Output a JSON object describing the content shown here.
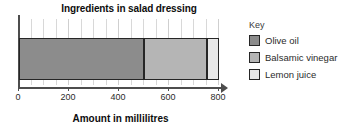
{
  "chart_data": {
    "type": "bar",
    "orientation": "horizontal",
    "stacked": true,
    "title": "Ingredients in salad dressing",
    "xlabel": "Amount in millilitres",
    "ylabel": "",
    "xlim": [
      0,
      800
    ],
    "grid": true,
    "grid_minor_step": 50,
    "legend_position": "right",
    "legend_title": "Key",
    "categories": [
      "Salad dressing"
    ],
    "series": [
      {
        "name": "Olive oil",
        "values": [
          500
        ],
        "start": 0,
        "end": 500,
        "color": "#8c8c8c"
      },
      {
        "name": "Balsamic vinegar",
        "values": [
          250
        ],
        "start": 500,
        "end": 750,
        "color": "#b5b5b5"
      },
      {
        "name": "Lemon juice",
        "values": [
          50
        ],
        "start": 750,
        "end": 800,
        "color": "#e8e8e8"
      }
    ],
    "total": 800,
    "xticks": [
      0,
      200,
      400,
      600,
      800
    ],
    "xtick_labels": [
      "0",
      "200",
      "400",
      "600",
      "800"
    ]
  },
  "axis": {
    "line_color": "#4d4d4d",
    "arrow": true
  },
  "legend": {
    "title": "Key",
    "items": [
      {
        "label": "Olive oil",
        "color": "#8c8c8c"
      },
      {
        "label": "Balsamic vinegar",
        "color": "#b5b5b5"
      },
      {
        "label": "Lemon juice",
        "color": "#e8e8e8"
      }
    ]
  }
}
